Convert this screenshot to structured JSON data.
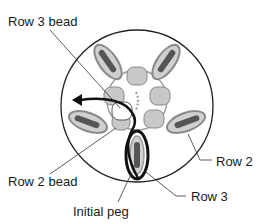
{
  "diagram": {
    "labels": {
      "row3_bead": "Row 3 bead",
      "row2": "Row 2",
      "row2_bead": "Row 2 bead",
      "row3": "Row 3",
      "initial_peg": "Initial peg"
    },
    "colors": {
      "outline": "#222222",
      "bead_fill": "#c8c8c8",
      "peg_loop": "#9a9a9a",
      "peg_core": "#555555",
      "highlight_bead": "#ffffff",
      "arrow": "#111111"
    }
  }
}
